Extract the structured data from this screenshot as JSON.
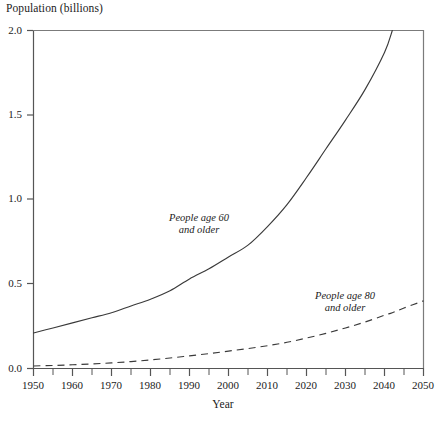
{
  "chart_data": {
    "type": "line",
    "title": "",
    "xlabel": "Year",
    "ylabel": "Population (billions)",
    "xlim": [
      1950,
      2050
    ],
    "ylim": [
      0.0,
      2.0
    ],
    "grid": false,
    "legend_position": "inline-annotations",
    "x_ticks": [
      1950,
      1960,
      1970,
      1980,
      1990,
      2000,
      2010,
      2020,
      2030,
      2040,
      2050
    ],
    "x_minor_ticks": [
      1955,
      1965,
      1975,
      1985,
      1995,
      2005,
      2015,
      2025,
      2035,
      2045
    ],
    "y_ticks": [
      0.0,
      0.5,
      1.0,
      1.5,
      2.0
    ],
    "y_tick_labels": [
      "0.0",
      "0.5",
      "1.0",
      "1.5",
      "2.0"
    ],
    "x": [
      1950,
      1955,
      1960,
      1965,
      1970,
      1975,
      1980,
      1985,
      1990,
      1995,
      2000,
      2005,
      2010,
      2015,
      2020,
      2025,
      2030,
      2035,
      2040,
      2042,
      2045,
      2050
    ],
    "series": [
      {
        "name": "People age 60 and older",
        "style": "solid",
        "color": "#3a3a3a",
        "annotation": "People age 60\nand older",
        "values": [
          0.21,
          0.24,
          0.27,
          0.3,
          0.33,
          0.37,
          0.41,
          0.46,
          0.53,
          0.59,
          0.66,
          0.73,
          0.84,
          0.97,
          1.13,
          1.3,
          1.47,
          1.65,
          1.87,
          2.0,
          null,
          null
        ]
      },
      {
        "name": "People age 80 and older",
        "style": "dashed",
        "color": "#3a3a3a",
        "annotation": "People age 80\nand older",
        "values": [
          0.015,
          0.018,
          0.022,
          0.027,
          0.033,
          0.041,
          0.051,
          0.062,
          0.075,
          0.088,
          0.103,
          0.118,
          0.135,
          0.155,
          0.18,
          0.208,
          0.24,
          0.275,
          0.315,
          0.33,
          0.358,
          0.4
        ]
      }
    ],
    "annotations": [
      {
        "id": "age60",
        "line1": "People age 60",
        "line2": "and older"
      },
      {
        "id": "age80",
        "line1": "People age 80",
        "line2": "and older"
      }
    ],
    "axis_color": "#555555",
    "line_color": "#3a3a3a",
    "background": "#ffffff"
  }
}
